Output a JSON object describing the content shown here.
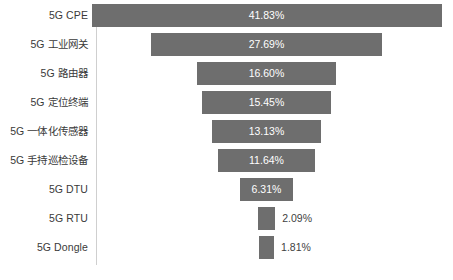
{
  "chart_data": {
    "type": "bar",
    "orientation": "horizontal-centered-funnel",
    "title": "",
    "subtitle": "",
    "xlabel": "",
    "ylabel": "",
    "grid": false,
    "legend": null,
    "axis_line": "vertical category axis at left of plot",
    "value_suffix": "%",
    "xlim": [
      0,
      41.83
    ],
    "categories": [
      "5G CPE",
      "5G 工业网关",
      "5G 路由器",
      "5G 定位终端",
      "5G 一体化传感器",
      "5G 手持巡检设备",
      "5G DTU",
      "5G RTU",
      "5G Dongle"
    ],
    "values": [
      41.83,
      27.69,
      16.6,
      15.45,
      13.13,
      11.64,
      6.31,
      2.09,
      1.81
    ],
    "value_labels": [
      "41.83%",
      "27.69%",
      "16.60%",
      "15.45%",
      "13.13%",
      "11.64%",
      "6.31%",
      "2.09%",
      "1.81%"
    ],
    "label_placement": [
      "inside",
      "inside",
      "inside",
      "inside",
      "inside",
      "inside",
      "inside",
      "outside",
      "outside"
    ],
    "colors": {
      "bar_fill": "#6e6e6e",
      "inside_label": "#ffffff",
      "outside_label": "#3f3f3f",
      "category_label": "#3a3a3a",
      "axis_line": "#cfcfcf",
      "background": "#ffffff"
    }
  }
}
